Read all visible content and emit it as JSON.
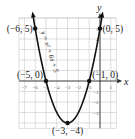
{
  "chart_data": {
    "type": "line",
    "title": "",
    "equation": "y = x² + 6x + 5",
    "xlabel": "x",
    "ylabel": "y",
    "xlim": [
      -7.5,
      1.5
    ],
    "ylim": [
      -4.5,
      6
    ],
    "grid": true,
    "x_ticks": [
      "-7",
      "-6",
      "-5",
      "-4",
      "-3",
      "-2",
      "-1",
      "1"
    ],
    "y_ticks": [
      "5",
      "4",
      "1",
      "-1",
      "-2",
      "-3"
    ],
    "series": [
      {
        "name": "y = x² + 6x + 5",
        "function": "x^2 + 6x + 5",
        "x_range": [
          -6.2,
          0.2
        ]
      }
    ],
    "points": [
      {
        "x": -6,
        "y": 5,
        "label": "(−6, 5)"
      },
      {
        "x": 0,
        "y": 5,
        "label": "(0, 5)"
      },
      {
        "x": -5,
        "y": 0,
        "label": "(−5, 0)"
      },
      {
        "x": -1,
        "y": 0,
        "label": "(−1, 0)"
      },
      {
        "x": -3,
        "y": -4,
        "label": "(−3, −4)"
      }
    ],
    "colors": {
      "curve": "#111111",
      "grid": "#c8c8c8",
      "axis": "#333333",
      "background": "#ffffff"
    }
  }
}
